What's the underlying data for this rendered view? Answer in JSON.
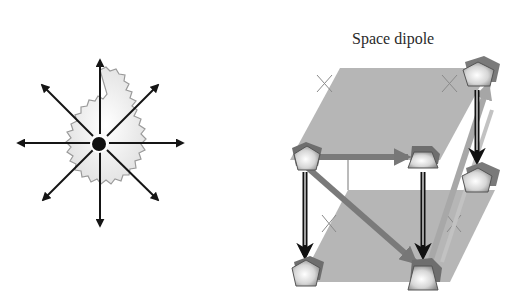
{
  "figure": {
    "left_panel": {
      "label": "",
      "description": "point source with 8 radial arrows over a fractal (Koch-snowflake-like) shaded region",
      "arrow_count": 8,
      "center_marker": "black dot"
    },
    "right_panel": {
      "title": "Space dipole",
      "description": "two parallel shaded planes (upper and lower) with six pentagonal nodes connected by arrows",
      "planes": [
        "upper",
        "lower"
      ],
      "nodes": [
        {
          "id": "top-left",
          "shape": "pentagon"
        },
        {
          "id": "top-middle",
          "shape": "trapezoid"
        },
        {
          "id": "top-right",
          "shape": "pentagon"
        },
        {
          "id": "mid-right",
          "shape": "pentagon"
        },
        {
          "id": "bottom-left",
          "shape": "pentagon"
        },
        {
          "id": "bottom-middle",
          "shape": "trapezoid"
        }
      ],
      "connections": [
        {
          "from": "top-left",
          "to": "top-middle",
          "style": "gray arrow"
        },
        {
          "from": "top-left",
          "to": "bottom-left",
          "style": "black double-line arrow"
        },
        {
          "from": "top-middle",
          "to": "bottom-middle",
          "style": "black double-line arrow"
        },
        {
          "from": "top-right",
          "to": "mid-right",
          "style": "black double-line arrow"
        },
        {
          "from": "top-left",
          "to": "bottom-middle",
          "style": "gray diagonal arrow"
        },
        {
          "from": "bottom-middle",
          "to": "top-right",
          "style": "light gray diagonal arrow"
        }
      ],
      "markers": "small x marks on plane edges"
    }
  },
  "colors": {
    "plane": "#b4b4b4",
    "arrow_dark": "#1a1a1a",
    "arrow_gray": "#7a7a7a",
    "arrow_light": "#a8a8a8",
    "node_dark": "#6e6e6e",
    "node_light": "#ececec"
  }
}
